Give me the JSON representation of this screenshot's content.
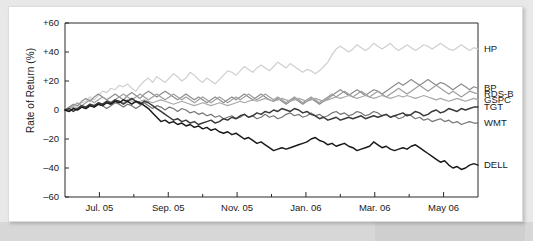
{
  "chart_data": {
    "type": "line",
    "title": "",
    "xlabel": "",
    "ylabel": "Rate of Return (%)",
    "ylim": [
      -60,
      60
    ],
    "yticks": [
      "+60",
      "+40",
      "+20",
      "0",
      "–20",
      "–40",
      "–60"
    ],
    "ytick_values": [
      60,
      40,
      20,
      0,
      -20,
      -40,
      -60
    ],
    "xticks": [
      "Jul. 05",
      "Sep. 05",
      "Nov. 05",
      "Jan. 06",
      "Mar. 06",
      "May 06"
    ],
    "xtick_positions": [
      1,
      3,
      5,
      7,
      9,
      11
    ],
    "x_range": [
      0,
      12
    ],
    "grid": false,
    "legend_position": "right-end-of-line",
    "series": [
      {
        "name": "HP",
        "color": "#cfcfcf",
        "end_value": 42,
        "values": [
          0,
          1,
          3,
          2,
          5,
          6,
          9,
          7,
          10,
          13,
          12,
          15,
          14,
          17,
          16,
          18,
          15,
          13,
          17,
          20,
          22,
          19,
          23,
          21,
          19,
          22,
          25,
          23,
          20,
          22,
          26,
          24,
          21,
          19,
          22,
          20,
          18,
          21,
          24,
          27,
          26,
          24,
          27,
          30,
          28,
          26,
          29,
          31,
          29,
          27,
          30,
          33,
          31,
          29,
          32,
          30,
          28,
          26,
          28,
          27,
          25,
          27,
          30,
          33,
          38,
          42,
          44,
          42,
          40,
          42,
          45,
          43,
          41,
          43,
          46,
          44,
          42,
          44,
          46,
          43,
          41,
          43,
          45,
          43,
          41,
          43,
          45,
          44,
          42,
          44,
          46,
          44,
          42,
          41,
          43,
          45,
          43,
          41,
          43,
          42
        ]
      },
      {
        "name": "BP",
        "color": "#8c8c8c",
        "end_value": 15,
        "values": [
          0,
          2,
          4,
          3,
          6,
          8,
          6,
          9,
          11,
          9,
          7,
          9,
          11,
          9,
          7,
          10,
          12,
          10,
          8,
          11,
          13,
          11,
          9,
          11,
          13,
          11,
          9,
          7,
          9,
          11,
          9,
          7,
          9,
          7,
          5,
          7,
          9,
          7,
          5,
          7,
          9,
          7,
          9,
          11,
          9,
          7,
          9,
          11,
          9,
          7,
          6,
          8,
          6,
          4,
          6,
          8,
          6,
          4,
          6,
          8,
          6,
          4,
          6,
          8,
          10,
          12,
          14,
          12,
          10,
          12,
          14,
          12,
          10,
          12,
          14,
          13,
          11,
          13,
          15,
          17,
          19,
          17,
          19,
          21,
          19,
          17,
          19,
          21,
          19,
          17,
          19,
          18,
          16,
          14,
          16,
          18,
          16,
          14,
          16,
          15
        ]
      },
      {
        "name": "RDS-B",
        "color": "#9e9e9e",
        "end_value": 11,
        "values": [
          0,
          1,
          3,
          5,
          3,
          5,
          7,
          5,
          7,
          9,
          7,
          5,
          7,
          9,
          11,
          9,
          7,
          9,
          11,
          9,
          7,
          9,
          11,
          9,
          7,
          9,
          11,
          9,
          7,
          9,
          7,
          5,
          7,
          9,
          7,
          5,
          7,
          9,
          7,
          5,
          7,
          9,
          7,
          9,
          11,
          9,
          7,
          9,
          11,
          9,
          7,
          9,
          7,
          5,
          7,
          9,
          7,
          5,
          7,
          9,
          7,
          5,
          7,
          9,
          11,
          9,
          11,
          13,
          11,
          9,
          11,
          13,
          11,
          9,
          11,
          13,
          11,
          9,
          11,
          13,
          15,
          13,
          11,
          13,
          15,
          17,
          15,
          13,
          15,
          17,
          15,
          13,
          11,
          13,
          11,
          9,
          11,
          13,
          12,
          11
        ]
      },
      {
        "name": "GSPC",
        "color": "#a8a8a8",
        "end_value": 7,
        "values": [
          0,
          1,
          2,
          1,
          3,
          2,
          4,
          3,
          5,
          4,
          6,
          5,
          7,
          6,
          5,
          7,
          6,
          5,
          6,
          7,
          6,
          5,
          6,
          7,
          6,
          5,
          4,
          5,
          6,
          5,
          4,
          3,
          4,
          5,
          4,
          3,
          4,
          5,
          4,
          3,
          4,
          5,
          6,
          5,
          6,
          7,
          6,
          7,
          8,
          7,
          6,
          7,
          8,
          7,
          6,
          7,
          8,
          7,
          6,
          7,
          8,
          7,
          6,
          7,
          8,
          9,
          8,
          9,
          10,
          9,
          8,
          9,
          10,
          9,
          8,
          9,
          10,
          9,
          8,
          9,
          10,
          9,
          10,
          9,
          8,
          9,
          10,
          9,
          8,
          7,
          8,
          7,
          6,
          7,
          8,
          7,
          6,
          7,
          8,
          7
        ]
      },
      {
        "name": "WMT",
        "color": "#757575",
        "end_value": -9,
        "values": [
          0,
          -1,
          1,
          0,
          2,
          1,
          3,
          2,
          4,
          3,
          1,
          3,
          5,
          4,
          2,
          4,
          3,
          1,
          3,
          5,
          3,
          1,
          3,
          2,
          0,
          2,
          1,
          -1,
          1,
          0,
          -2,
          -1,
          -3,
          -2,
          -4,
          -3,
          -5,
          -4,
          -6,
          -5,
          -4,
          -6,
          -5,
          -3,
          -5,
          -4,
          -6,
          -5,
          -3,
          -5,
          -4,
          -6,
          -5,
          -3,
          -2,
          -4,
          -3,
          -5,
          -4,
          -2,
          -4,
          -3,
          -5,
          -4,
          -2,
          -1,
          -3,
          -2,
          -4,
          -3,
          -1,
          -2,
          -4,
          -3,
          -1,
          -2,
          -4,
          -3,
          -5,
          -4,
          -6,
          -5,
          -3,
          -4,
          -6,
          -5,
          -7,
          -6,
          -8,
          -7,
          -6,
          -8,
          -7,
          -9,
          -8,
          -10,
          -9,
          -8,
          -9,
          -9
        ]
      },
      {
        "name": "TGT",
        "color": "#3a3a3a",
        "end_value": 2,
        "values": [
          0,
          1,
          -1,
          1,
          3,
          2,
          4,
          3,
          5,
          4,
          6,
          5,
          7,
          6,
          4,
          6,
          8,
          6,
          4,
          6,
          5,
          3,
          1,
          -1,
          -3,
          -5,
          -7,
          -6,
          -8,
          -7,
          -9,
          -8,
          -10,
          -9,
          -8,
          -7,
          -9,
          -8,
          -6,
          -7,
          -5,
          -6,
          -4,
          -3,
          -5,
          -4,
          -2,
          -3,
          -1,
          -2,
          0,
          -1,
          1,
          0,
          -1,
          1,
          0,
          -2,
          -1,
          -3,
          -4,
          -6,
          -5,
          -7,
          -6,
          -5,
          -7,
          -6,
          -5,
          -6,
          -5,
          -4,
          -6,
          -5,
          -4,
          -5,
          -4,
          -3,
          -5,
          -4,
          -3,
          -2,
          -4,
          -3,
          -1,
          -2,
          -4,
          -3,
          -1,
          0,
          -2,
          -1,
          1,
          0,
          -1,
          1,
          0,
          1,
          2,
          2
        ]
      },
      {
        "name": "DELL",
        "color": "#1a1a1a",
        "end_value": -38,
        "values": [
          0,
          -1,
          1,
          0,
          2,
          1,
          3,
          2,
          4,
          3,
          5,
          4,
          6,
          5,
          7,
          6,
          4,
          6,
          5,
          3,
          1,
          -2,
          -5,
          -8,
          -7,
          -9,
          -8,
          -10,
          -9,
          -11,
          -10,
          -12,
          -11,
          -13,
          -12,
          -14,
          -13,
          -15,
          -16,
          -15,
          -17,
          -16,
          -18,
          -20,
          -19,
          -21,
          -23,
          -22,
          -24,
          -26,
          -28,
          -27,
          -26,
          -27,
          -26,
          -25,
          -24,
          -23,
          -22,
          -20,
          -19,
          -21,
          -22,
          -24,
          -23,
          -25,
          -24,
          -23,
          -25,
          -26,
          -28,
          -27,
          -26,
          -25,
          -22,
          -24,
          -26,
          -25,
          -27,
          -28,
          -27,
          -26,
          -27,
          -25,
          -24,
          -26,
          -28,
          -30,
          -32,
          -34,
          -36,
          -35,
          -38,
          -40,
          -39,
          -41,
          -40,
          -38,
          -37,
          -38
        ]
      }
    ]
  }
}
